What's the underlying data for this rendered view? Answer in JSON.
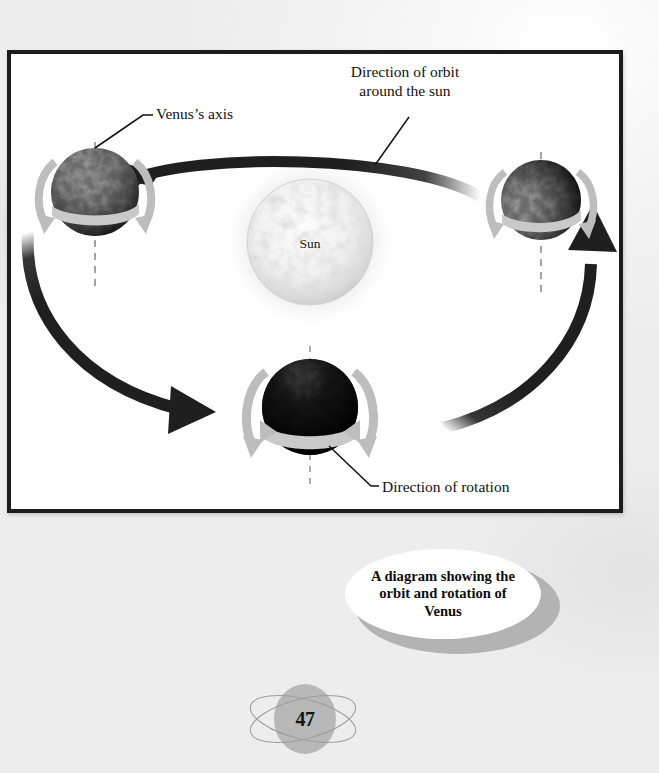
{
  "figure": {
    "labels": {
      "venus_axis": "Venus’s axis",
      "direction_of_orbit_line1": "Direction of orbit",
      "direction_of_orbit_line2": "around the sun",
      "sun": "Sun",
      "direction_of_rotation": "Direction of rotation"
    },
    "objects": {
      "sun_name": "Sun",
      "planet_left_name": "Venus",
      "planet_right_name": "Venus",
      "planet_bottom_name": "Venus"
    }
  },
  "caption": {
    "line1": "A diagram showing the",
    "line2": "orbit and rotation of",
    "line3": "Venus",
    "full_text": "A diagram showing the orbit and rotation of Venus"
  },
  "page": {
    "number": "47"
  },
  "colors": {
    "frame_border": "#1c1c1c",
    "arrow_black": "#1f1f1f",
    "rotation_arrow_grey": "#b9b9b9",
    "equator_band": "#c9c9c9",
    "caption_ring_grey": "#b3b3b3",
    "badge_grey": "#b8b8b8",
    "paper": "#f5f5f5",
    "text": "#111111"
  }
}
